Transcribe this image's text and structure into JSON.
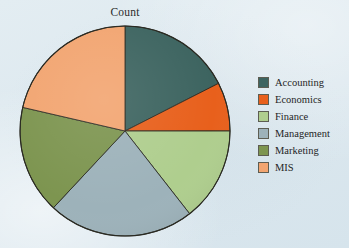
{
  "chart_data": {
    "type": "pie",
    "title": "Count",
    "xlabel": "",
    "ylabel": "",
    "legend_position": "right",
    "grid": false,
    "start_angle_deg": 0,
    "direction": "clockwise",
    "categories": [
      "Accounting",
      "Economics",
      "Finance",
      "Management",
      "Marketing",
      "MIS"
    ],
    "values": [
      17.5,
      7.5,
      14.4,
      22.5,
      16.7,
      21.4
    ],
    "units": "percent",
    "colors": [
      "#3d6460",
      "#e8601c",
      "#afce8e",
      "#9db2ba",
      "#7d9550",
      "#f2a571"
    ],
    "slices": [
      {
        "label": "Accounting",
        "value": 17.5,
        "start_deg": 0,
        "end_deg": 63,
        "color": "#3d6460"
      },
      {
        "label": "Economics",
        "value": 7.5,
        "start_deg": 63,
        "end_deg": 90,
        "color": "#e8601c"
      },
      {
        "label": "Finance",
        "value": 14.4,
        "start_deg": 90,
        "end_deg": 142,
        "color": "#afce8e"
      },
      {
        "label": "Management",
        "value": 22.5,
        "start_deg": 142,
        "end_deg": 223,
        "color": "#9db2ba"
      },
      {
        "label": "Marketing",
        "value": 16.7,
        "start_deg": 223,
        "end_deg": 283,
        "color": "#7d9550"
      },
      {
        "label": "MIS",
        "value": 21.4,
        "start_deg": 283,
        "end_deg": 360,
        "color": "#f2a571"
      }
    ]
  },
  "chart": {
    "title": "Count",
    "background_color": "#dfeaf0",
    "slice_outline_color": "#2a2a22"
  },
  "legend": {
    "items": [
      {
        "label": "Accounting",
        "color": "#3d6460"
      },
      {
        "label": "Economics",
        "color": "#e8601c"
      },
      {
        "label": "Finance",
        "color": "#afce8e"
      },
      {
        "label": "Management",
        "color": "#9db2ba"
      },
      {
        "label": "Marketing",
        "color": "#7d9550"
      },
      {
        "label": "MIS",
        "color": "#f2a571"
      }
    ]
  }
}
